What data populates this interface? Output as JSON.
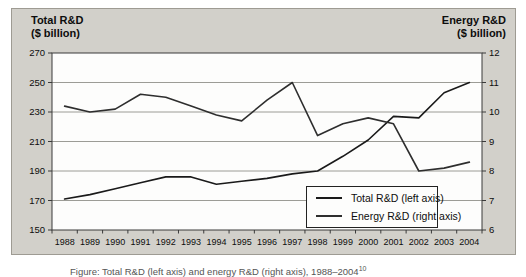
{
  "panel": {
    "background": "#d2d0ca",
    "border_color": "#9e9b93"
  },
  "left_axis_title": "Total R&D\n($ billion)",
  "right_axis_title": "Energy R&D\n($ billion)",
  "legend": {
    "items": [
      {
        "label": "Total R&D (left axis)",
        "color": "#1a1a1a"
      },
      {
        "label": "Energy R&D (right axis)",
        "color": "#2e2e2e"
      }
    ]
  },
  "caption": {
    "text": "Figure: Total R&D (left axis) and energy R&D (right axis), 1988–2004",
    "superscript": "10"
  },
  "chart_data": {
    "type": "line",
    "x": [
      1988,
      1989,
      1990,
      1991,
      1992,
      1993,
      1994,
      1995,
      1996,
      1997,
      1998,
      1999,
      2000,
      2001,
      2002,
      2003,
      2004
    ],
    "series": [
      {
        "name": "Total R&D (left axis)",
        "axis": "left",
        "color": "#1a1a1a",
        "values": [
          171,
          174,
          178,
          182,
          186,
          186,
          181,
          183,
          185,
          188,
          190,
          200,
          211,
          227,
          226,
          243,
          250
        ]
      },
      {
        "name": "Energy R&D (right axis)",
        "axis": "right",
        "color": "#2e2e2e",
        "values": [
          10.2,
          10.0,
          10.1,
          10.6,
          10.5,
          10.2,
          9.9,
          9.7,
          10.4,
          11.0,
          9.2,
          9.6,
          9.8,
          9.6,
          8.0,
          8.1,
          8.3
        ]
      }
    ],
    "left_axis": {
      "label": "Total R&D ($ billion)",
      "min": 150,
      "max": 270,
      "ticks": [
        150,
        170,
        190,
        210,
        230,
        250,
        270
      ]
    },
    "right_axis": {
      "label": "Energy R&D ($ billion)",
      "min": 6,
      "max": 12,
      "ticks": [
        6,
        7,
        8,
        9,
        10,
        11,
        12
      ]
    },
    "grid": true,
    "gridline_color": "#9c9c96",
    "axis_color": "#3a3a3a",
    "plot_background": "#fdfdfc",
    "legend_position": "inside-bottom-right"
  }
}
